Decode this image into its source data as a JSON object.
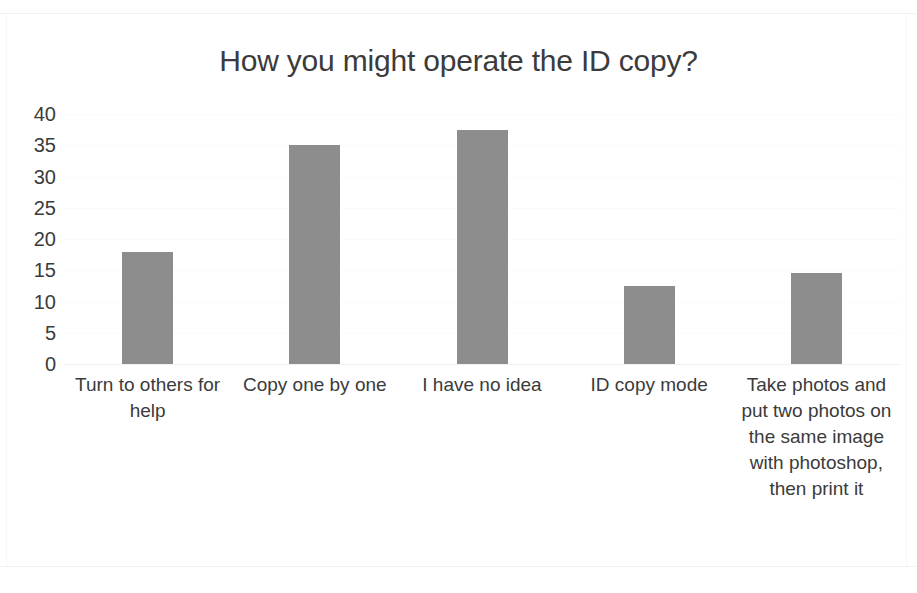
{
  "chart_data": {
    "type": "bar",
    "title": "How you might operate the ID copy?",
    "xlabel": "",
    "ylabel": "",
    "ylim": [
      0,
      40
    ],
    "ytick_step": 5,
    "yticks": [
      40,
      35,
      30,
      25,
      20,
      15,
      10,
      5,
      0
    ],
    "grid": true,
    "legend": null,
    "bar_color": "#8d8d8d",
    "categories": [
      "Turn to others for help",
      "Copy one by one",
      "I have no idea",
      "ID copy mode",
      "Take photos and put two photos on the same image with photoshop, then print it"
    ],
    "values": [
      18,
      35,
      37.5,
      12.5,
      14.5
    ],
    "series": [
      {
        "name": "",
        "values": [
          18,
          35,
          37.5,
          12.5,
          14.5
        ]
      }
    ]
  },
  "axis": {
    "y_ticks": [
      {
        "label": "40",
        "value": 40
      },
      {
        "label": "35",
        "value": 35
      },
      {
        "label": "30",
        "value": 30
      },
      {
        "label": "25",
        "value": 25
      },
      {
        "label": "20",
        "value": 20
      },
      {
        "label": "15",
        "value": 15
      },
      {
        "label": "10",
        "value": 10
      },
      {
        "label": "5",
        "value": 5
      },
      {
        "label": "0",
        "value": 0
      }
    ]
  }
}
